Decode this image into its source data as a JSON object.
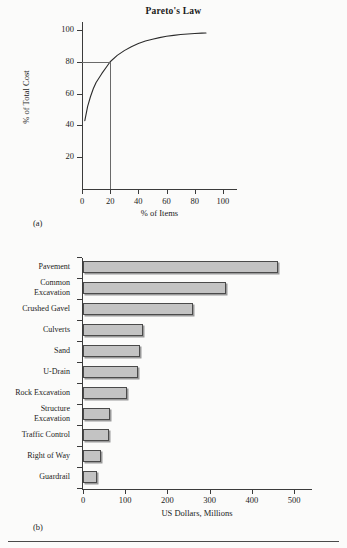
{
  "figure": {
    "panel_a_label": "(a)",
    "panel_b_label": "(b)"
  },
  "chart_data": [
    {
      "type": "line",
      "title": "Pareto's Law",
      "xlabel": "% of Items",
      "ylabel": "% of Total Cost",
      "xlim": [
        0,
        110
      ],
      "ylim": [
        0,
        105
      ],
      "xticks": [
        0,
        20,
        40,
        60,
        80,
        100
      ],
      "yticks": [
        20,
        40,
        60,
        80,
        100
      ],
      "grid": false,
      "legend": "none",
      "annotations": [
        {
          "name": "80-20-guide",
          "x": 20,
          "y": 80,
          "description": "horizontal guide at 80% of total cost meeting vertical guide at 20% of items"
        }
      ],
      "x": [
        2,
        4,
        6,
        8,
        10,
        14,
        18,
        20,
        25,
        30,
        35,
        40,
        45,
        50,
        55,
        60,
        65,
        70,
        75,
        80,
        85,
        88
      ],
      "y": [
        43,
        52,
        58,
        63,
        67,
        72.5,
        77.5,
        80,
        84,
        87,
        89.5,
        91.5,
        93,
        94.2,
        95.2,
        96,
        96.6,
        97.1,
        97.5,
        97.8,
        98,
        98.1
      ]
    },
    {
      "type": "bar",
      "orientation": "horizontal",
      "title": "",
      "xlabel": "US Dollars, Millions",
      "ylabel": "",
      "xlim": [
        0,
        500
      ],
      "xticks": [
        0,
        100,
        200,
        300,
        400,
        500
      ],
      "grid": false,
      "legend": "none",
      "categories": [
        "Pavement",
        "Common Excavation",
        "Crushed Gavel",
        "Culverts",
        "Sand",
        "U-Drain",
        "Rock Excavation",
        "Structure Excavation",
        "Traffic Control",
        "Right of Way",
        "Guardrail"
      ],
      "category_lines": [
        [
          "Pavement"
        ],
        [
          "Common",
          "Excavation"
        ],
        [
          "Crushed Gavel"
        ],
        [
          "Culverts"
        ],
        [
          "Sand"
        ],
        [
          "U-Drain"
        ],
        [
          "Rock Excavation"
        ],
        [
          "Structure",
          "Excavation"
        ],
        [
          "Traffic Control"
        ],
        [
          "Right of Way"
        ],
        [
          "Guardrail"
        ]
      ],
      "values": [
        463,
        338,
        260,
        142,
        136,
        130,
        105,
        65,
        61,
        42,
        33
      ]
    }
  ],
  "colors": {
    "bar_fill": "#c3c3c3",
    "bar_border": "#4a4a4a",
    "bar_shadow": "#9a9a9a",
    "axis": "#3b3b3b",
    "guide": "#6a6a6a",
    "page_background": "#fbfbfa",
    "text": "#1b1b1b"
  }
}
